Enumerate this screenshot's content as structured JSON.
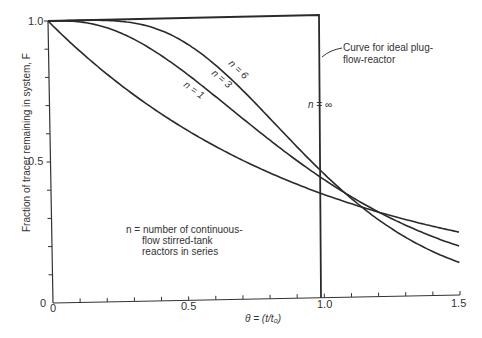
{
  "chart_data": {
    "type": "line",
    "title": "",
    "xlabel": "θ = (t/t₀)",
    "ylabel": "Fraction of tracer remaining in system, F",
    "xlim": [
      0,
      1.5
    ],
    "ylim": [
      0,
      1.0
    ],
    "x_ticks": [
      "0",
      "0.5",
      "1.0",
      "1.5"
    ],
    "y_ticks": [
      "0",
      "0.5",
      "1.0"
    ],
    "x_minor_step": 0.1,
    "y_minor_step": 0.1,
    "grid": false,
    "legend": null,
    "x": [
      0,
      0.1,
      0.2,
      0.3,
      0.4,
      0.5,
      0.6,
      0.7,
      0.8,
      0.9,
      1.0,
      1.1,
      1.2,
      1.3,
      1.4,
      1.5
    ],
    "series": [
      {
        "name": "n = 1",
        "values": [
          1.0,
          0.905,
          0.819,
          0.741,
          0.67,
          0.607,
          0.549,
          0.497,
          0.449,
          0.407,
          0.368,
          0.333,
          0.301,
          0.273,
          0.247,
          0.223
        ]
      },
      {
        "name": "n = 3",
        "values": [
          1.0,
          0.996,
          0.977,
          0.937,
          0.879,
          0.809,
          0.731,
          0.65,
          0.57,
          0.494,
          0.423,
          0.359,
          0.303,
          0.253,
          0.21,
          0.174
        ]
      },
      {
        "name": "n = 6",
        "values": [
          1.0,
          1.0,
          0.998,
          0.987,
          0.958,
          0.916,
          0.844,
          0.753,
          0.651,
          0.547,
          0.446,
          0.355,
          0.276,
          0.21,
          0.156,
          0.116
        ]
      },
      {
        "name": "n = ∞",
        "values": [
          1.0,
          1.0,
          1.0,
          1.0,
          1.0,
          1.0,
          1.0,
          1.0,
          1.0,
          1.0,
          0.0,
          0.0,
          0.0,
          0.0,
          0.0,
          0.0
        ]
      }
    ],
    "annotations": [
      "Curve for ideal plug-flow-reactor",
      "n = number of continuous-flow stirred-tank reactors in series"
    ]
  },
  "labels": {
    "y_axis": "Fraction of tracer remaining in system, F",
    "x_axis": "θ = (t/t₀)",
    "x_tick_0": "0",
    "x_tick_05": "0.5",
    "x_tick_10": "1.0",
    "x_tick_15": "1.5",
    "y_tick_0": "0",
    "y_tick_05": "0.5",
    "y_tick_10": "1.0",
    "curve_n1": "n = 1",
    "curve_n3": "n = 3",
    "curve_n6": "n = 6",
    "curve_ninf": "n = ∞",
    "plug_line1": "Curve for ideal plug-",
    "plug_line2": "flow-reactor",
    "note_line1": "n = number of continuous-",
    "note_line2": "flow stirred-tank",
    "note_line3": "reactors in series"
  }
}
